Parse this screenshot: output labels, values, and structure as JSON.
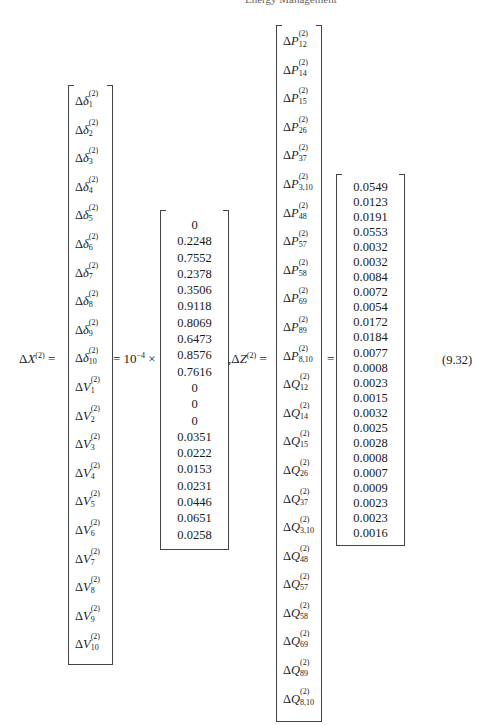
{
  "header": {
    "left": "",
    "right": "Energy Management"
  },
  "equation": {
    "number": "(9.32)",
    "lhs_x": {
      "base": "X",
      "sup": "(2)",
      "prefix": "Δ"
    },
    "equals": "=",
    "scale_text": "= 10",
    "scale_exp": "−4",
    "times": "×",
    "comma": ",",
    "lhs_z": {
      "base": "Z",
      "sup": "(2)",
      "prefix": "Δ"
    },
    "equals2": "=",
    "equals3": "="
  },
  "x_vector": [
    {
      "v": "δ",
      "sub": "1"
    },
    {
      "v": "δ",
      "sub": "2"
    },
    {
      "v": "δ",
      "sub": "3"
    },
    {
      "v": "δ",
      "sub": "4"
    },
    {
      "v": "δ",
      "sub": "5"
    },
    {
      "v": "δ",
      "sub": "6"
    },
    {
      "v": "δ",
      "sub": "7"
    },
    {
      "v": "δ",
      "sub": "8"
    },
    {
      "v": "δ",
      "sub": "9"
    },
    {
      "v": "δ",
      "sub": "10"
    },
    {
      "v": "V",
      "sub": "1"
    },
    {
      "v": "V",
      "sub": "2"
    },
    {
      "v": "V",
      "sub": "3"
    },
    {
      "v": "V",
      "sub": "4"
    },
    {
      "v": "V",
      "sub": "5"
    },
    {
      "v": "V",
      "sub": "6"
    },
    {
      "v": "V",
      "sub": "7"
    },
    {
      "v": "V",
      "sub": "8"
    },
    {
      "v": "V",
      "sub": "9"
    },
    {
      "v": "V",
      "sub": "10"
    }
  ],
  "x_values": [
    "0",
    "0.2248",
    "0.7552",
    "0.2378",
    "0.3506",
    "0.9118",
    "0.8069",
    "0.6473",
    "0.8576",
    "0.7616",
    "0",
    "0",
    "0",
    "0.0351",
    "0.0222",
    "0.0153",
    "0.0231",
    "0.0446",
    "0.0651",
    "0.0258"
  ],
  "z_vector": [
    {
      "v": "P",
      "sub": "12"
    },
    {
      "v": "P",
      "sub": "14"
    },
    {
      "v": "P",
      "sub": "15"
    },
    {
      "v": "P",
      "sub": "26"
    },
    {
      "v": "P",
      "sub": "37"
    },
    {
      "v": "P",
      "sub": "3,10"
    },
    {
      "v": "P",
      "sub": "48"
    },
    {
      "v": "P",
      "sub": "57"
    },
    {
      "v": "P",
      "sub": "58"
    },
    {
      "v": "P",
      "sub": "69"
    },
    {
      "v": "P",
      "sub": "89"
    },
    {
      "v": "P",
      "sub": "8,10"
    },
    {
      "v": "Q",
      "sub": "12"
    },
    {
      "v": "Q",
      "sub": "14"
    },
    {
      "v": "Q",
      "sub": "15"
    },
    {
      "v": "Q",
      "sub": "26"
    },
    {
      "v": "Q",
      "sub": "37"
    },
    {
      "v": "Q",
      "sub": "3,10"
    },
    {
      "v": "Q",
      "sub": "48"
    },
    {
      "v": "Q",
      "sub": "57"
    },
    {
      "v": "Q",
      "sub": "58"
    },
    {
      "v": "Q",
      "sub": "69"
    },
    {
      "v": "Q",
      "sub": "89"
    },
    {
      "v": "Q",
      "sub": "8,10"
    }
  ],
  "z_values": [
    "0.0549",
    "0.0123",
    "0.0191",
    "0.0553",
    "0.0032",
    "0.0032",
    "0.0084",
    "0.0072",
    "0.0054",
    "0.0172",
    "0.0184",
    "0.0077",
    "0.0008",
    "0.0023",
    "0.0015",
    "0.0032",
    "0.0025",
    "0.0028",
    "0.0008",
    "0.0007",
    "0.0009",
    "0.0023",
    "0.0023",
    "0.0016"
  ],
  "superscript": "(2)",
  "delta": "Δ"
}
